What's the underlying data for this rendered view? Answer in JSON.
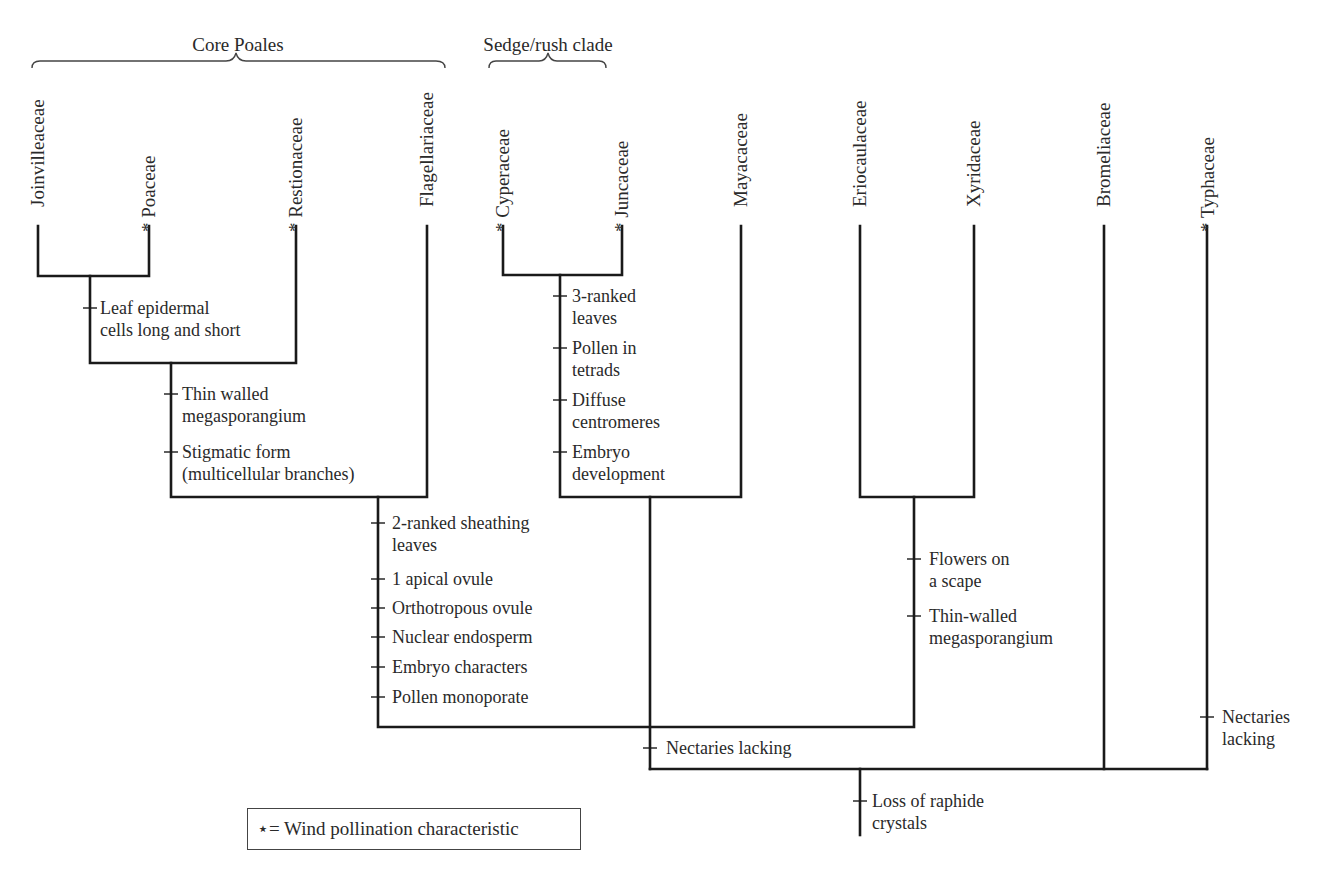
{
  "diagram": {
    "type": "cladogram",
    "clades": [
      {
        "label": "Core Poales",
        "x_from": 38,
        "x_to": 445
      },
      {
        "label": "Sedge/rush clade",
        "x_from": 489,
        "x_to": 606
      }
    ],
    "taxa": [
      {
        "name": "Joinvilleaceae",
        "wind": false,
        "x": 38
      },
      {
        "name": "Poaceae",
        "wind": true,
        "x": 149
      },
      {
        "name": "Restionaceae",
        "wind": true,
        "x": 296
      },
      {
        "name": "Flagellariaceae",
        "wind": false,
        "x": 427
      },
      {
        "name": "Cyperaceae",
        "wind": true,
        "x": 503
      },
      {
        "name": "Juncaceae",
        "wind": true,
        "x": 622
      },
      {
        "name": "Mayacaceae",
        "wind": false,
        "x": 741
      },
      {
        "name": "Eriocaulaceae",
        "wind": false,
        "x": 860
      },
      {
        "name": "Xyridaceae",
        "wind": false,
        "x": 974
      },
      {
        "name": "Bromeliaceae",
        "wind": false,
        "x": 1104
      },
      {
        "name": "Typhaceae",
        "wind": true,
        "x": 1208
      }
    ],
    "characters": {
      "joinvilleaceae_poaceae": [
        "Leaf epidermal\ncells long and short"
      ],
      "core_poales": [
        "Thin walled\nmegasporangium",
        "Stigmatic form\n(multicellular branches)"
      ],
      "sedge_rush": [
        "3-ranked\nleaves",
        "Pollen in\ntetrads",
        "Diffuse\ncentromeres",
        "Embryo\ndevelopment"
      ],
      "graminid": [
        "2-ranked sheathing\nleaves",
        "1 apical ovule",
        "Orthotropous ovule",
        "Nuclear endosperm",
        "Embryo characters",
        "Pollen monoporate"
      ],
      "xyrid": [
        "Flowers on\na scape",
        "Thin-walled\nmegasporangium"
      ],
      "cyperid_group": [
        "Nectaries lacking"
      ],
      "typhaceae": [
        "Nectaries\nlacking"
      ],
      "root": [
        "Loss of raphide\ncrystals"
      ]
    },
    "legend": {
      "symbol": "⋆",
      "text": "= Wind pollination characteristic"
    },
    "wind_marker": "*"
  }
}
